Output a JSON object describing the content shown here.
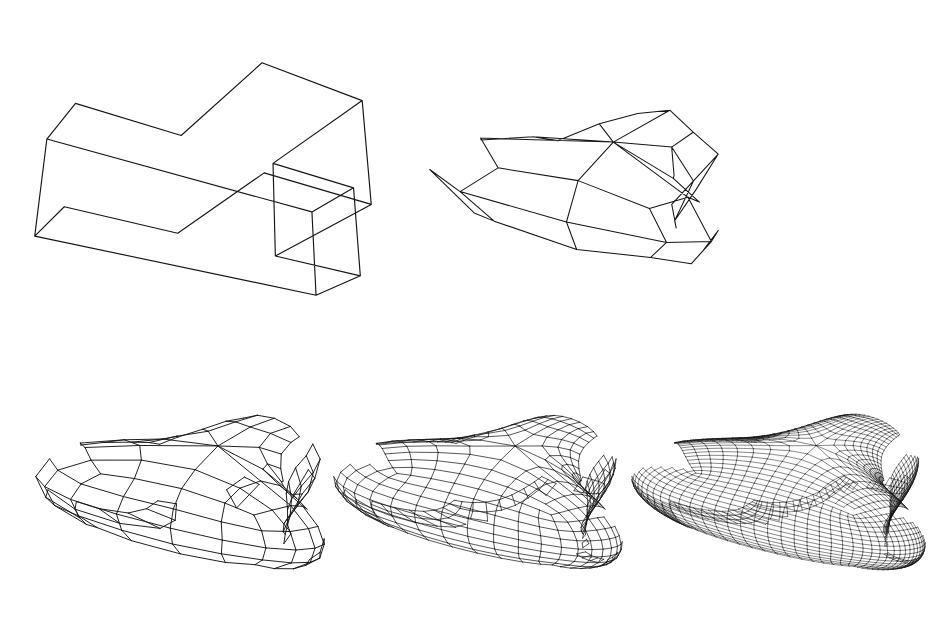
{
  "figure": {
    "width": 935,
    "height": 632,
    "background_color": "#ffffff",
    "line_color": "#151515",
    "panel_count": 5
  },
  "panels": [
    {
      "id": "control-polyhedron",
      "name": "T-shaped control cage",
      "subdivision_level": 0,
      "render_mode": "solid-block",
      "line_width": 1.15,
      "x": 28,
      "y": 14,
      "width": 350,
      "height": 330
    },
    {
      "id": "subdivision-level-1",
      "name": "First subdivision step",
      "subdivision_level": 1,
      "render_mode": "wireframe",
      "line_width": 1.05,
      "x": 424,
      "y": 42,
      "width": 300,
      "height": 290
    },
    {
      "id": "subdivision-level-2",
      "name": "Second subdivision step",
      "subdivision_level": 2,
      "render_mode": "wireframe",
      "line_width": 0.95,
      "x": 30,
      "y": 362,
      "width": 300,
      "height": 260
    },
    {
      "id": "subdivision-level-3",
      "name": "Third subdivision step",
      "subdivision_level": 3,
      "render_mode": "wireframe",
      "line_width": 0.72,
      "x": 328,
      "y": 362,
      "width": 300,
      "height": 260
    },
    {
      "id": "subdivision-level-4",
      "name": "Fourth subdivision step (limit surface)",
      "subdivision_level": 4,
      "render_mode": "wireframe",
      "line_width": 0.5,
      "x": 626,
      "y": 362,
      "width": 305,
      "height": 260
    }
  ],
  "chart_data": {
    "type": "diagram",
    "control_mesh": {
      "comment": "Axis-aligned T-shaped extruded prism. Units are model-space; x to the right, y up, z toward viewer.",
      "profile_outline_xz": [
        [
          -3.0,
          1.6
        ],
        [
          3.0,
          1.6
        ],
        [
          3.0,
          0.2
        ],
        [
          1.0,
          0.2
        ],
        [
          1.0,
          -2.4
        ],
        [
          -1.0,
          -2.4
        ],
        [
          -1.0,
          0.2
        ],
        [
          -3.0,
          0.2
        ]
      ],
      "extrusion_axis": "y",
      "extrusion_half_height": 0.95,
      "vertex_count": 16,
      "face_count": 10,
      "edge_count": 24,
      "extraordinary_vertices": 4,
      "extraordinary_valence": 5
    },
    "subdivision_levels": [
      {
        "level": 0,
        "faces": 10,
        "label": "control cage"
      },
      {
        "level": 1,
        "faces": 40,
        "label": "1 step"
      },
      {
        "level": 2,
        "faces": 160,
        "label": "2 steps"
      },
      {
        "level": 3,
        "faces": 640,
        "label": "3 steps"
      },
      {
        "level": 4,
        "faces": 2560,
        "label": "4 steps"
      }
    ],
    "camera": {
      "azimuth_deg": -32,
      "elevation_deg": 26,
      "projection": "perspective",
      "focal_length": 9.0,
      "distance": 13.5
    },
    "rules": {
      "face_point": "average of face vertices",
      "edge_point": "average of the two endpoints and the two adjacent face points",
      "vertex_point": "(F + 2R + (n-3)P) / n"
    }
  },
  "captions": {
    "show": false,
    "items": []
  }
}
